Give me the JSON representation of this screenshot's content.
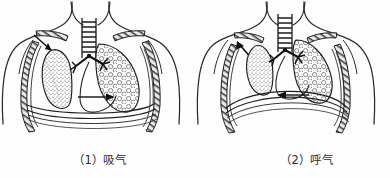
{
  "figure": {
    "title": "",
    "background_color": "#fefefe",
    "ink_color": "#1a1a1a"
  },
  "panels": [
    {
      "id": "inhale",
      "caption": "（1）吸气",
      "number_label": "（1）",
      "phase_label": "吸气",
      "phase_english": "inhalation",
      "diaphragm_state": "flattened-lowered",
      "lung_state": "expanded",
      "arrow_direction": "right",
      "rib_arrow": "up-outward",
      "parts": {
        "trachea": "trachea",
        "left_lung": "left-lung-stippled",
        "right_lung": "right-lung-alveolar",
        "bronchi": "bronchi",
        "ribs": "rib-cage",
        "diaphragm": "diaphragm",
        "torso": "torso-outline"
      }
    },
    {
      "id": "exhale",
      "caption": "（2）呼气",
      "number_label": "（2）",
      "phase_label": "呼气",
      "phase_english": "exhalation",
      "diaphragm_state": "domed-raised",
      "lung_state": "contracted",
      "arrow_direction": "left",
      "rib_arrow": "down-inward",
      "parts": {
        "trachea": "trachea",
        "left_lung": "left-lung-stippled",
        "right_lung": "right-lung-alveolar",
        "bronchi": "bronchi",
        "ribs": "rib-cage",
        "diaphragm": "diaphragm",
        "torso": "torso-outline"
      }
    }
  ]
}
